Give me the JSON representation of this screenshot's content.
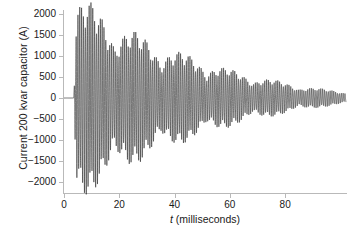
{
  "chart_data": {
    "type": "line",
    "title": "",
    "xlabel": "t (milliseconds)",
    "ylabel": "Current 200 kvar capacitor (A)",
    "xlabel_italic_part": "t",
    "xlabel_rest": " (milliseconds)",
    "xlim": [
      0,
      102
    ],
    "ylim": [
      -2200,
      2200
    ],
    "xticks": [
      0,
      20,
      40,
      60,
      80
    ],
    "xtick_labels": [
      "0",
      "20",
      "40",
      "60",
      "80"
    ],
    "yticks": [
      2000,
      1500,
      1000,
      500,
      0,
      -500,
      -1000,
      -1500,
      -2000
    ],
    "ytick_labels": [
      "2000",
      "1500",
      "1000",
      "500",
      "0",
      "-500",
      "-1000",
      "-1500",
      "-2000"
    ],
    "grid": false,
    "legend": null,
    "line_color": "#2a2a2a",
    "axis_color": "#b9b9b9",
    "series": [
      {
        "name": "Current 200 kvar capacitor",
        "switching_time_ms": 3.5,
        "ring_frequency_hz": 1480,
        "envelope_decay_tau_ms": 33,
        "envelope_peak_a": 2150,
        "beat_frequency_hz": 60,
        "steady_residual_a": 150,
        "envelope_samples": [
          {
            "t_ms": 0,
            "amplitude_a": 0
          },
          {
            "t_ms": 3.5,
            "amplitude_a": 0
          },
          {
            "t_ms": 4.5,
            "amplitude_a": 2150
          },
          {
            "t_ms": 8,
            "amplitude_a": 2050
          },
          {
            "t_ms": 12,
            "amplitude_a": 1850
          },
          {
            "t_ms": 16,
            "amplitude_a": 1700
          },
          {
            "t_ms": 20,
            "amplitude_a": 1550
          },
          {
            "t_ms": 25,
            "amplitude_a": 1400
          },
          {
            "t_ms": 30,
            "amplitude_a": 1250
          },
          {
            "t_ms": 35,
            "amplitude_a": 1100
          },
          {
            "t_ms": 40,
            "amplitude_a": 1000
          },
          {
            "t_ms": 45,
            "amplitude_a": 900
          },
          {
            "t_ms": 50,
            "amplitude_a": 800
          },
          {
            "t_ms": 55,
            "amplitude_a": 700
          },
          {
            "t_ms": 60,
            "amplitude_a": 600
          },
          {
            "t_ms": 65,
            "amplitude_a": 520
          },
          {
            "t_ms": 70,
            "amplitude_a": 450
          },
          {
            "t_ms": 75,
            "amplitude_a": 390
          },
          {
            "t_ms": 80,
            "amplitude_a": 330
          },
          {
            "t_ms": 85,
            "amplitude_a": 270
          },
          {
            "t_ms": 90,
            "amplitude_a": 220
          },
          {
            "t_ms": 95,
            "amplitude_a": 180
          },
          {
            "t_ms": 100,
            "amplitude_a": 150
          }
        ]
      }
    ]
  }
}
